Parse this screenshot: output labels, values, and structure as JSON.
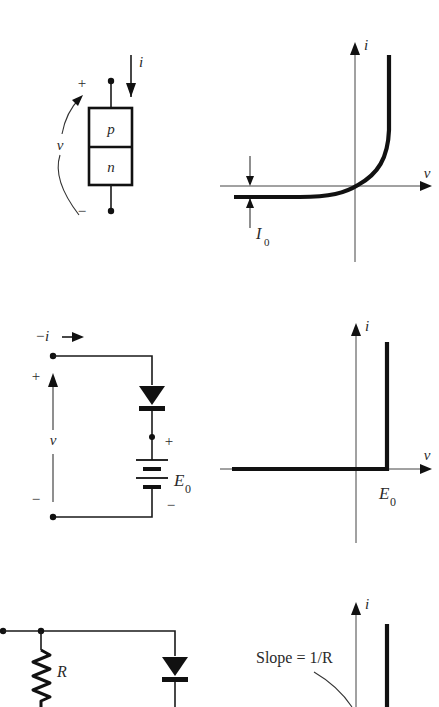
{
  "figure": {
    "panels": [
      {
        "id": "pn-junction",
        "circuit": {
          "current_label": "i",
          "voltage_label": "v",
          "plus_label": "+",
          "minus_label": "−",
          "top_region_label": "p",
          "bottom_region_label": "n"
        },
        "plot": {
          "x_axis_label": "v",
          "y_axis_label": "i",
          "annotation_label": "I",
          "annotation_subscript": "0",
          "curve_type": "exponential diode characteristic"
        }
      },
      {
        "id": "ideal-diode-with-source",
        "circuit": {
          "current_label": "−i",
          "voltage_label": "v",
          "plus_label": "+",
          "minus_label": "−",
          "battery_plus_label": "+",
          "battery_minus_label": "−",
          "source_label": "E",
          "source_subscript": "0"
        },
        "plot": {
          "x_axis_label": "v",
          "y_axis_label": "i",
          "knee_label": "E",
          "knee_subscript": "0",
          "curve_type": "piecewise linear: zero current until v = E0, then vertical"
        }
      },
      {
        "id": "diode-with-resistor",
        "circuit": {
          "resistor_label": "R"
        },
        "plot": {
          "y_axis_label": "i",
          "slope_annotation": "Slope = 1/R"
        }
      }
    ]
  }
}
